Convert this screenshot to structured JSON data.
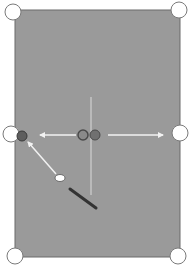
{
  "diagram": {
    "type": "pool-table-shot-diagram",
    "colors": {
      "background": "#ffffff",
      "table": "#9a9a9a",
      "table_border": "#6a6a6a",
      "pocket_fill": "#ffffff",
      "pocket_stroke": "#7a7a7a",
      "center_line": "#c4c4c4",
      "arrow": "#f2f2f2",
      "object_ball": "#5e5e5e",
      "ghost_ball_stroke": "#4a4a4a",
      "cue_ball": "#ffffff",
      "cue_stick": "#333333"
    },
    "table": {
      "x": 15,
      "y": 10,
      "width": 165,
      "height": 247
    },
    "pockets": [
      {
        "name": "top-left",
        "cx": 13,
        "cy": 12,
        "r": 8
      },
      {
        "name": "top-right",
        "cx": 179,
        "cy": 10,
        "r": 8
      },
      {
        "name": "side-left",
        "cx": 11,
        "cy": 134,
        "r": 8
      },
      {
        "name": "side-right",
        "cx": 180,
        "cy": 133,
        "r": 8
      },
      {
        "name": "bottom-left",
        "cx": 15,
        "cy": 256,
        "r": 8
      },
      {
        "name": "bottom-right",
        "cx": 178,
        "cy": 256,
        "r": 8
      }
    ],
    "center_line": {
      "x1": 91,
      "y1": 97,
      "x2": 91,
      "y2": 195
    },
    "balls": {
      "ghost_ball": {
        "cx": 83,
        "cy": 135,
        "r": 5
      },
      "object_ball": {
        "cx": 95,
        "cy": 135,
        "r": 5
      },
      "target_ball": {
        "cx": 22,
        "cy": 136,
        "r": 5
      },
      "cue_ball": {
        "cx": 60,
        "cy": 178,
        "rx": 5,
        "ry": 3.5
      }
    },
    "arrows": [
      {
        "name": "left-path",
        "x1": 76,
        "y1": 135,
        "x2": 40,
        "y2": 135
      },
      {
        "name": "right-path",
        "x1": 108,
        "y1": 135,
        "x2": 163,
        "y2": 135
      },
      {
        "name": "cue-path",
        "x1": 56,
        "y1": 174,
        "x2": 28,
        "y2": 142
      }
    ],
    "cue_stick": {
      "x1": 70,
      "y1": 189,
      "x2": 96,
      "y2": 208
    }
  }
}
